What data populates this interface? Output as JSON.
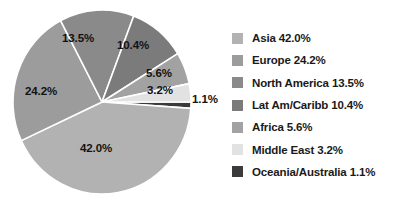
{
  "chart_data": {
    "type": "pie",
    "title": "",
    "subtitle": "",
    "xlabel": "",
    "ylabel": "",
    "grid": false,
    "legend_position": "right",
    "start_angle_deg": 0,
    "direction": "clockwise",
    "categories": [
      "Asia",
      "Europe",
      "North America",
      "Lat Am/Caribb",
      "Africa",
      "Middle East",
      "Oceania/Australia"
    ],
    "values": [
      42.0,
      24.2,
      13.5,
      10.4,
      5.6,
      3.2,
      1.1
    ],
    "units": "percent",
    "colors": [
      "#b2b2b2",
      "#9c9c9c",
      "#8a8a8a",
      "#7b7b7b",
      "#a2a2a2",
      "#e2e2e2",
      "#3b3b3b"
    ],
    "slice_order_clockwise_from_3oclock": [
      "Oceania/Australia",
      "Asia",
      "Europe",
      "North America",
      "Lat Am/Caribb",
      "Africa",
      "Middle East"
    ],
    "data_labels": [
      "42.0%",
      "24.2%",
      "13.5%",
      "10.4%",
      "5.6%",
      "3.2%",
      "1.1%"
    ]
  },
  "pie": {
    "labels": {
      "asia": "42.0%",
      "europe": "24.2%",
      "north_america": "13.5%",
      "lat_am": "10.4%",
      "africa": "5.6%",
      "middle_east": "3.2%",
      "oceania": "1.1%"
    }
  },
  "legend": {
    "items": [
      {
        "label": "Asia 42.0%",
        "color": "#b2b2b2"
      },
      {
        "label": "Europe 24.2%",
        "color": "#9c9c9c"
      },
      {
        "label": "North America 13.5%",
        "color": "#8a8a8a"
      },
      {
        "label": "Lat Am/Caribb 10.4%",
        "color": "#7b7b7b"
      },
      {
        "label": "Africa 5.6%",
        "color": "#a2a2a2"
      },
      {
        "label": "Middle East 3.2%",
        "color": "#e2e2e2"
      },
      {
        "label": "Oceania/Australia 1.1%",
        "color": "#3b3b3b"
      }
    ]
  }
}
